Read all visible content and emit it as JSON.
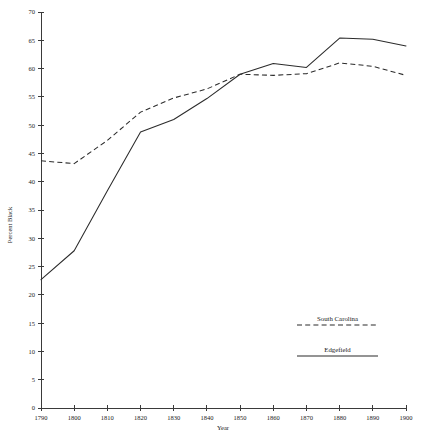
{
  "chart_data": {
    "type": "line",
    "title": "",
    "subtitle": "",
    "xlabel": "Year",
    "ylabel": "Percent Black",
    "x": [
      1790,
      1800,
      1810,
      1820,
      1830,
      1840,
      1850,
      1860,
      1870,
      1880,
      1890,
      1900
    ],
    "xlim": [
      1790,
      1900
    ],
    "ylim": [
      0,
      70
    ],
    "xticks": [
      1790,
      1800,
      1810,
      1820,
      1830,
      1840,
      1850,
      1860,
      1870,
      1880,
      1890,
      1900
    ],
    "yticks": [
      0,
      5,
      10,
      15,
      20,
      25,
      30,
      35,
      40,
      45,
      50,
      55,
      60,
      65,
      70
    ],
    "grid": false,
    "legend_position": "lower-right",
    "series": [
      {
        "name": "South Carolina",
        "style": "dashed",
        "color": "#2b2b2b",
        "values": [
          43.7,
          43.2,
          47.3,
          52.3,
          54.8,
          56.4,
          59.0,
          58.8,
          59.1,
          61.0,
          60.4,
          58.8
        ]
      },
      {
        "name": "Edgefield",
        "style": "solid",
        "color": "#2b2b2b",
        "values": [
          22.7,
          27.8,
          38.4,
          48.8,
          51.0,
          54.7,
          59.0,
          60.9,
          60.2,
          65.4,
          65.2,
          64.0
        ]
      }
    ],
    "xtick_labels": [
      "1790",
      "1800",
      "1810",
      "1820",
      "1830",
      "1840",
      "1850",
      "1860",
      "1870",
      "1880",
      "1890",
      "1900"
    ],
    "ytick_labels": [
      "0",
      "5",
      "10",
      "15",
      "20",
      "25",
      "30",
      "35",
      "40",
      "45",
      "50",
      "55",
      "60",
      "65",
      "70"
    ]
  },
  "legend": {
    "entries": [
      {
        "label": "South Carolina",
        "style": "dashed"
      },
      {
        "label": "Edgefield",
        "style": "solid"
      }
    ]
  },
  "axes": {
    "x_title": "Year",
    "y_title": "Percent Black"
  }
}
